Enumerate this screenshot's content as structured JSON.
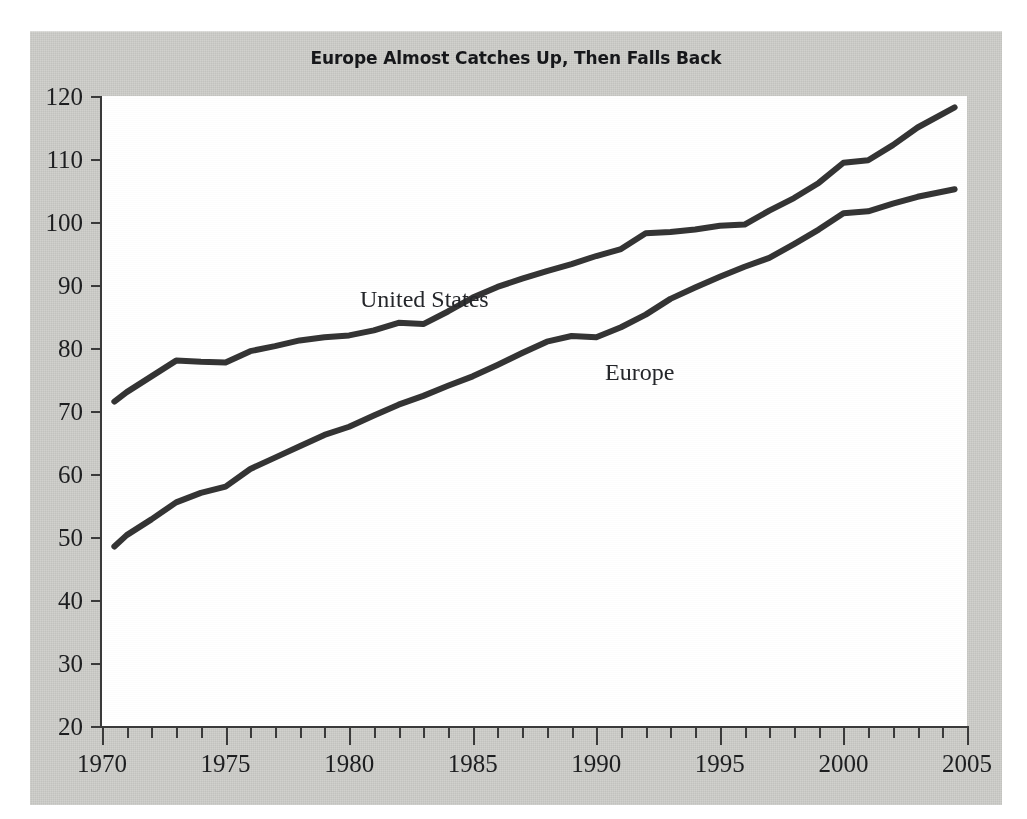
{
  "figure": {
    "title": "Europe Almost Catches Up, Then Falls Back",
    "background_color": "#cfcfcb",
    "plot_background_color": "#ffffff",
    "line_color": "#343434",
    "axis_color": "#3a3a3a"
  },
  "annotations": {
    "united_states": "United States",
    "europe": "Europe"
  },
  "axes": {
    "y_ticks": [
      20,
      30,
      40,
      50,
      60,
      70,
      80,
      90,
      100,
      110,
      120
    ],
    "y_tick_labels": [
      "20",
      "30",
      "40",
      "50",
      "60",
      "70",
      "80",
      "90",
      "100",
      "110",
      "120"
    ],
    "x_major_ticks": [
      1970,
      1975,
      1980,
      1985,
      1990,
      1995,
      2000,
      2005
    ],
    "x_major_tick_labels": [
      "1970",
      "1975",
      "1980",
      "1985",
      "1990",
      "1995",
      "2000",
      "2005"
    ],
    "x_minor_tick_step": 1
  },
  "chart_data": {
    "type": "line",
    "title": "Europe Almost Catches Up, Then Falls Back",
    "xlabel": "",
    "ylabel": "",
    "xlim": [
      1970,
      2005
    ],
    "ylim": [
      20,
      120
    ],
    "grid": false,
    "legend": "inline-annotations",
    "x": [
      1970.5,
      1971,
      1972,
      1973,
      1974,
      1975,
      1976,
      1977,
      1978,
      1979,
      1980,
      1981,
      1982,
      1983,
      1984,
      1985,
      1986,
      1987,
      1988,
      1989,
      1990,
      1991,
      1992,
      1993,
      1994,
      1995,
      1996,
      1997,
      1998,
      1999,
      2000,
      2001,
      2002,
      2003,
      2004.5
    ],
    "series": [
      {
        "name": "United States",
        "values": [
          71.5,
          73.0,
          75.5,
          78.0,
          77.8,
          77.7,
          79.5,
          80.3,
          81.2,
          81.7,
          82.0,
          82.8,
          84.0,
          83.8,
          85.8,
          88.0,
          89.7,
          91.0,
          92.2,
          93.3,
          94.6,
          95.7,
          98.2,
          98.4,
          98.8,
          99.4,
          99.6,
          101.8,
          103.8,
          106.2,
          109.4,
          109.8,
          112.2,
          115.0,
          118.2
        ]
      },
      {
        "name": "Europe",
        "values": [
          48.5,
          50.3,
          52.8,
          55.5,
          57.0,
          58.0,
          60.8,
          62.6,
          64.4,
          66.2,
          67.5,
          69.3,
          71.0,
          72.4,
          74.0,
          75.5,
          77.3,
          79.2,
          81.0,
          81.9,
          81.7,
          83.3,
          85.3,
          87.8,
          89.6,
          91.3,
          92.9,
          94.3,
          96.5,
          98.8,
          101.4,
          101.7,
          102.9,
          104.0,
          105.2
        ]
      }
    ]
  }
}
